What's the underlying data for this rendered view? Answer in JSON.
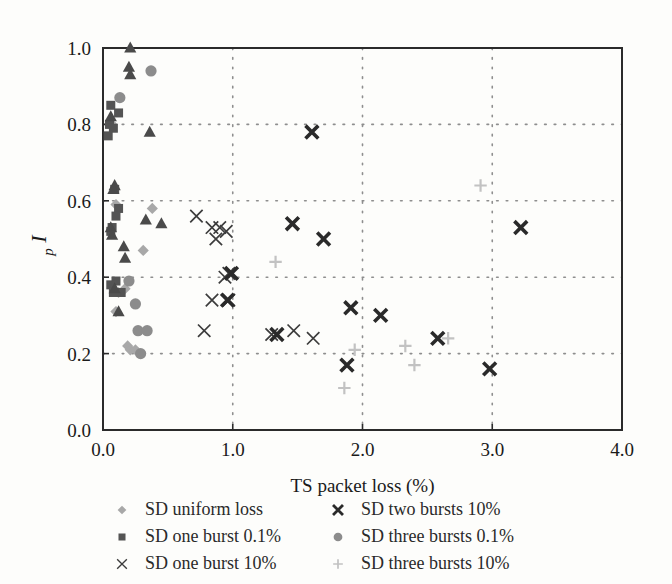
{
  "chart_data": {
    "type": "scatter",
    "title": "",
    "xlabel": "TS packet loss (%)",
    "ylabel": "I_p",
    "ylabel_main": "I",
    "ylabel_sub": "p",
    "xlim": [
      0.0,
      4.0
    ],
    "ylim": [
      0.0,
      1.0
    ],
    "xticks": [
      "0.0",
      "1.0",
      "2.0",
      "3.0",
      "4.0"
    ],
    "xtick_values": [
      0.0,
      1.0,
      2.0,
      3.0,
      4.0
    ],
    "yticks": [
      "0.0",
      "0.2",
      "0.4",
      "0.6",
      "0.8",
      "1.0"
    ],
    "ytick_values": [
      0.0,
      0.2,
      0.4,
      0.6,
      0.8,
      1.0
    ],
    "grid": "dotted-both",
    "legend_position": "below-plot-two-columns",
    "series": [
      {
        "name": "SD uniform loss",
        "marker": "diamond",
        "color": "#a8a8a8",
        "points": [
          [
            0.07,
            0.8
          ],
          [
            0.1,
            0.59
          ],
          [
            0.12,
            0.36
          ],
          [
            0.1,
            0.31
          ],
          [
            0.17,
            0.37
          ],
          [
            0.19,
            0.22
          ],
          [
            0.21,
            0.21
          ],
          [
            0.38,
            0.58
          ],
          [
            0.31,
            0.47
          ],
          [
            0.25,
            0.21
          ]
        ]
      },
      {
        "name": "SD one burst 0.1%",
        "marker": "square",
        "color": "#545454",
        "points": [
          [
            0.06,
            0.85
          ],
          [
            0.12,
            0.83
          ],
          [
            0.05,
            0.8
          ],
          [
            0.08,
            0.79
          ],
          [
            0.04,
            0.77
          ],
          [
            0.09,
            0.63
          ],
          [
            0.12,
            0.58
          ],
          [
            0.1,
            0.56
          ],
          [
            0.07,
            0.53
          ],
          [
            0.06,
            0.52
          ],
          [
            0.1,
            0.39
          ],
          [
            0.06,
            0.38
          ],
          [
            0.14,
            0.36
          ],
          [
            0.08,
            0.36
          ]
        ]
      },
      {
        "name": "SD one burst 10%",
        "marker": "thin-x",
        "color": "#3c3c3c",
        "points": [
          [
            0.72,
            0.56
          ],
          [
            0.84,
            0.53
          ],
          [
            0.9,
            0.53
          ],
          [
            0.95,
            0.52
          ],
          [
            0.87,
            0.5
          ],
          [
            0.97,
            0.41
          ],
          [
            0.94,
            0.4
          ],
          [
            0.97,
            0.34
          ],
          [
            0.84,
            0.34
          ],
          [
            0.78,
            0.26
          ],
          [
            1.3,
            0.25
          ],
          [
            1.62,
            0.24
          ],
          [
            1.47,
            0.26
          ]
        ]
      },
      {
        "name": "SD two bursts 10%",
        "marker": "bold-x",
        "color": "#2a2a2a",
        "points": [
          [
            1.61,
            0.78
          ],
          [
            1.46,
            0.54
          ],
          [
            1.7,
            0.5
          ],
          [
            3.22,
            0.53
          ],
          [
            0.99,
            0.41
          ],
          [
            0.96,
            0.34
          ],
          [
            1.34,
            0.25
          ],
          [
            1.91,
            0.32
          ],
          [
            2.14,
            0.3
          ],
          [
            2.58,
            0.24
          ],
          [
            1.88,
            0.17
          ],
          [
            2.98,
            0.16
          ]
        ]
      },
      {
        "name": "SD three bursts 0.1%",
        "marker": "circle",
        "color": "#8c8c8c",
        "points": [
          [
            0.37,
            0.94
          ],
          [
            0.13,
            0.87
          ],
          [
            0.2,
            0.39
          ],
          [
            0.25,
            0.33
          ],
          [
            0.27,
            0.26
          ],
          [
            0.34,
            0.26
          ],
          [
            0.29,
            0.2
          ]
        ]
      },
      {
        "name": "SD three bursts 10%",
        "marker": "plus",
        "color": "#c2c2c2",
        "points": [
          [
            1.33,
            0.44
          ],
          [
            1.94,
            0.21
          ],
          [
            2.33,
            0.22
          ],
          [
            2.4,
            0.17
          ],
          [
            2.66,
            0.24
          ],
          [
            2.91,
            0.64
          ],
          [
            1.86,
            0.11
          ]
        ]
      },
      {
        "name": "SD two bursts 0.1%",
        "marker": "triangle",
        "color": "#4a4a4a",
        "points": [
          [
            0.21,
            1.0
          ],
          [
            0.2,
            0.95
          ],
          [
            0.21,
            0.93
          ],
          [
            0.06,
            0.82
          ],
          [
            0.36,
            0.78
          ],
          [
            0.09,
            0.64
          ],
          [
            0.08,
            0.63
          ],
          [
            0.06,
            0.53
          ],
          [
            0.07,
            0.51
          ],
          [
            0.33,
            0.55
          ],
          [
            0.45,
            0.54
          ],
          [
            0.16,
            0.48
          ],
          [
            0.17,
            0.45
          ],
          [
            0.09,
            0.37
          ],
          [
            0.12,
            0.31
          ]
        ]
      }
    ]
  },
  "legend": {
    "left_column": [
      {
        "label": "SD uniform loss",
        "marker": "diamond",
        "color": "#a8a8a8"
      },
      {
        "label": "SD one burst 0.1%",
        "marker": "square",
        "color": "#545454"
      },
      {
        "label": "SD one burst 10%",
        "marker": "thin-x",
        "color": "#3c3c3c"
      }
    ],
    "right_column": [
      {
        "label": "SD two bursts 10%",
        "marker": "bold-x",
        "color": "#2a2a2a"
      },
      {
        "label": "SD three bursts 0.1%",
        "marker": "circle",
        "color": "#8c8c8c"
      },
      {
        "label": "SD three bursts 10%",
        "marker": "plus",
        "color": "#c2c2c2"
      }
    ]
  },
  "colors": {
    "background": "#fdfdfb",
    "axis": "#2b2b2b",
    "grid": "#8e8e8e",
    "text": "#1a1a1a"
  }
}
